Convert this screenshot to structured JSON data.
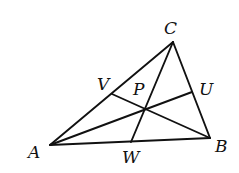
{
  "diagram": {
    "type": "triangle-cevians",
    "colors": {
      "stroke": "#111111",
      "background": "#ffffff"
    },
    "points": {
      "A": {
        "x": 50,
        "y": 145,
        "label": "A",
        "lx": 28,
        "ly": 158
      },
      "B": {
        "x": 210,
        "y": 138,
        "label": "B",
        "lx": 215,
        "ly": 152
      },
      "C": {
        "x": 173,
        "y": 42,
        "label": "C",
        "lx": 164,
        "ly": 34
      },
      "U": {
        "x": 192,
        "y": 92,
        "label": "U",
        "lx": 199,
        "ly": 95
      },
      "V": {
        "x": 112,
        "y": 94,
        "label": "V",
        "lx": 97,
        "ly": 90
      },
      "W": {
        "x": 131,
        "y": 142,
        "label": "W",
        "lx": 122,
        "ly": 163
      },
      "P": {
        "x": 144,
        "y": 109,
        "label": "P",
        "lx": 133,
        "ly": 95
      }
    },
    "segments": [
      {
        "from": "A",
        "to": "B"
      },
      {
        "from": "B",
        "to": "C"
      },
      {
        "from": "C",
        "to": "A"
      },
      {
        "from": "A",
        "to": "U"
      },
      {
        "from": "B",
        "to": "V"
      },
      {
        "from": "C",
        "to": "W"
      }
    ]
  }
}
